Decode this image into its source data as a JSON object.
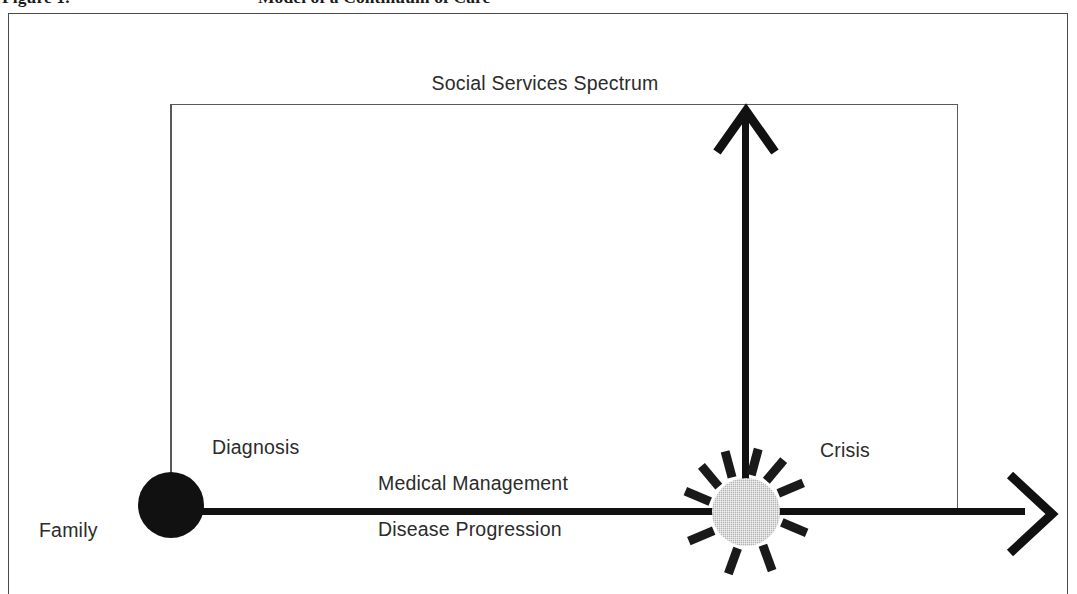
{
  "figure": {
    "caption_number": "Figure 1.",
    "caption_text": "Model of a Continuum of Care",
    "frame_color": "#4a4a4a",
    "background": "#ffffff"
  },
  "diagram": {
    "type": "conceptual-flow-diagram",
    "spectrum": {
      "label": "Social Services Spectrum",
      "rect_color": "#5a5a5a"
    },
    "axis": {
      "color": "#111111",
      "direction": "left-to-right",
      "arrow_head": "open-chevron",
      "above_label": "Medical Management",
      "below_label": "Disease Progression"
    },
    "vertical_arrow": {
      "color": "#111111",
      "direction": "bottom-to-top",
      "origin": "crisis-node",
      "target": "social-services-spectrum"
    },
    "nodes": [
      {
        "id": "family",
        "label": "Family",
        "position": "axis-start-lower-left",
        "marker": "none"
      },
      {
        "id": "diagnosis",
        "label": "Diagnosis",
        "marker": "filled-circle",
        "color": "#111111",
        "radius_px": 33
      },
      {
        "id": "crisis",
        "label": "Crisis",
        "marker": "halftone-circle-with-burst",
        "color": "#b2b2b2",
        "burst_color": "#1a1a1a",
        "radius_px": 34,
        "burst_ray_count": 10,
        "burst_ray_angles_deg": [
          23,
          50,
          75,
          105,
          130,
          157,
          203,
          250,
          290,
          337
        ]
      }
    ]
  }
}
